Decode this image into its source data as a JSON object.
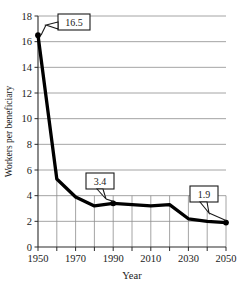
{
  "chart_data": {
    "type": "line",
    "title": "",
    "xlabel": "Year",
    "ylabel": "Workers per beneficiary",
    "xlim": [
      1950,
      2050
    ],
    "ylim": [
      0,
      18
    ],
    "grid": "horizontal gridlines across plot; vertical gridlines in lower band only",
    "legend": "none",
    "x": [
      1950,
      1960,
      1970,
      1980,
      1990,
      2000,
      2010,
      2020,
      2030,
      2040,
      2050
    ],
    "values": [
      16.5,
      5.3,
      3.9,
      3.2,
      3.4,
      3.3,
      3.2,
      3.3,
      2.2,
      2.0,
      1.9
    ],
    "series": [
      {
        "name": "Workers per beneficiary",
        "values": [
          16.5,
          5.3,
          3.9,
          3.2,
          3.4,
          3.3,
          3.2,
          3.3,
          2.2,
          2.0,
          1.9
        ]
      }
    ],
    "y_ticks": [
      0,
      2,
      4,
      6,
      8,
      10,
      12,
      14,
      16,
      18
    ],
    "y_tick_labels": [
      "0",
      "2",
      "4",
      "6",
      "8",
      "10",
      "12",
      "14",
      "16",
      "18"
    ],
    "x_ticks": [
      1950,
      1960,
      1970,
      1980,
      1990,
      2000,
      2010,
      2020,
      2030,
      2040,
      2050
    ],
    "x_tick_labels": [
      "1950",
      "",
      "1970",
      "",
      "1990",
      "",
      "2010",
      "",
      "2030",
      "",
      "2050"
    ],
    "x_labeled": [
      "1950",
      "1970",
      "1990",
      "2010",
      "2030",
      "2050"
    ],
    "annotations": [
      {
        "label": "16.5",
        "x": 1950,
        "y": 16.5
      },
      {
        "label": "3.4",
        "x": 1990,
        "y": 3.4
      },
      {
        "label": "1.9",
        "x": 2050,
        "y": 1.9
      }
    ],
    "marked_points": [
      {
        "x": 1950,
        "y": 16.5
      },
      {
        "x": 1990,
        "y": 3.4
      },
      {
        "x": 2050,
        "y": 1.9
      }
    ],
    "line_color": "#000000",
    "grid_color": "#8d8d8d",
    "axis_color": "#2b2b2b",
    "background": "#ffffff"
  }
}
